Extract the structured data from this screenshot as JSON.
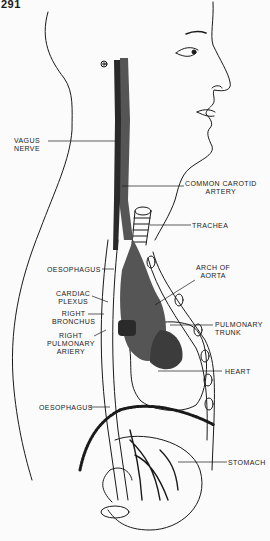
{
  "figure": {
    "number": "291"
  },
  "labels": {
    "vagus_nerve": [
      "VAGUS",
      "NERVE"
    ],
    "common_carotid_artery": [
      "COMMON CAROTID",
      "ARTERY"
    ],
    "trachea": [
      "TRACHEA"
    ],
    "oesophagus_upper": [
      "OESOPHAGUS"
    ],
    "arch_of_aorta": [
      "ARCH OF",
      "AORTA"
    ],
    "cardiac_plexus": [
      "CARDIAC",
      "PLEXUS"
    ],
    "right_bronchus": [
      "RIGHT",
      "BRONCHUS"
    ],
    "pulmonary_trunk": [
      "PULMONARY",
      "TRUNK"
    ],
    "right_pulmonary_artery": [
      "RIGHT",
      "PULMONARY",
      "ARIERY"
    ],
    "heart": [
      "HEART"
    ],
    "oesophagus_lower": [
      "OESOPHAGUS"
    ],
    "stomach": [
      "STOMACH"
    ]
  },
  "colors": {
    "ink": "#1a1a1a",
    "vessel_fill": "#555555",
    "vessel_dark": "#2a2a2a",
    "background": "#fbfbfb"
  }
}
